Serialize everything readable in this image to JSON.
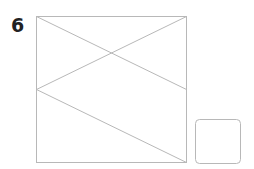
{
  "step": {
    "number": "6"
  },
  "colors": {
    "stroke": "#b8b8b8",
    "text": "#222222",
    "background": "#ffffff"
  },
  "diagram": {
    "large_box": {
      "x": 36,
      "y": 16,
      "width": 150,
      "height": 146,
      "type": "image-placeholder"
    },
    "lines": [
      {
        "from": [
          36,
          16
        ],
        "to": [
          186,
          89
        ]
      },
      {
        "from": [
          186,
          16
        ],
        "to": [
          36,
          89
        ]
      },
      {
        "from": [
          36,
          89
        ],
        "to": [
          186,
          162
        ]
      }
    ],
    "small_box": {
      "x": 195,
      "y": 119,
      "width": 45,
      "height": 44,
      "radius": 4
    }
  }
}
